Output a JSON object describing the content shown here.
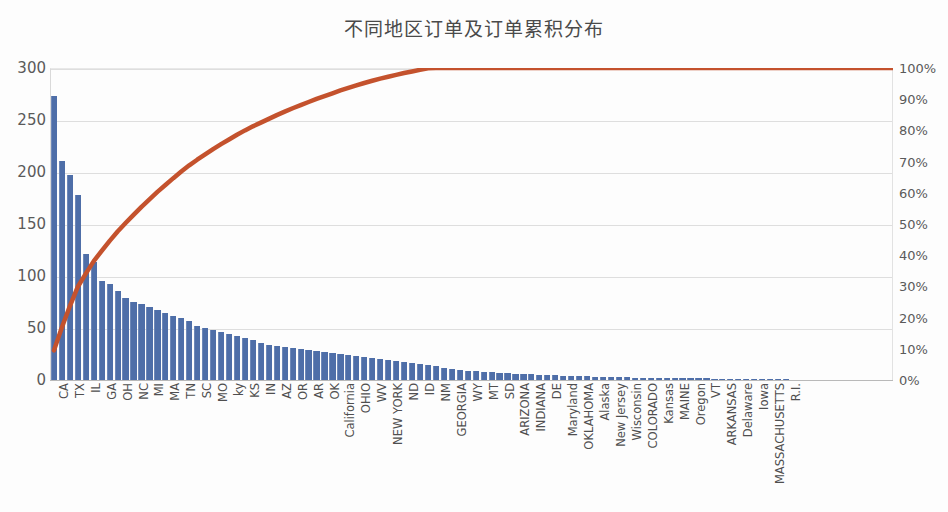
{
  "chart_data": {
    "type": "bar",
    "title": "不同地区订单及订单累积分布",
    "xlabel": "",
    "ylabel": "",
    "ylim": [
      0,
      300
    ],
    "y2lim": [
      0,
      100
    ],
    "grid": true,
    "legend": "none",
    "bar_color": "#4e6ea8",
    "line_color": "#c4522d",
    "yticks": [
      "0",
      "50",
      "100",
      "150",
      "200",
      "250",
      "300"
    ],
    "ytick_values": [
      0,
      50,
      100,
      150,
      200,
      250,
      300
    ],
    "y2ticks": [
      "0%",
      "10%",
      "20%",
      "30%",
      "40%",
      "50%",
      "60%",
      "70%",
      "80%",
      "90%",
      "100%"
    ],
    "y2tick_values": [
      0,
      10,
      20,
      30,
      40,
      50,
      60,
      70,
      80,
      90,
      100
    ],
    "categories": [
      "CA",
      "",
      "TX",
      "",
      "IL",
      "",
      "GA",
      "",
      "OH",
      "",
      "NC",
      "",
      "MI",
      "",
      "MA",
      "",
      "TN",
      "",
      "SC",
      "",
      "MO",
      "",
      "ky",
      "",
      "KS",
      "",
      "IN",
      "",
      "AZ",
      "",
      "OR",
      "",
      "AR",
      "",
      "OK",
      "",
      "California",
      "",
      "OHIO",
      "",
      "WV",
      "",
      "NEW YORK",
      "",
      "ND",
      "",
      "ID",
      "",
      "NM",
      "",
      "GEORGIA",
      "",
      "WY",
      "",
      "MT",
      "",
      "SD",
      "",
      "ARIZONA",
      "",
      "INDIANA",
      "",
      "DE",
      "",
      "Maryland",
      "",
      "OKLAHOMA",
      "",
      "Alaska",
      "",
      "New Jersey",
      "",
      "Wisconsin",
      "",
      "COLORADO",
      "",
      "Kansas",
      "",
      "MAINE",
      "",
      "Oregon",
      "",
      "VT",
      "",
      "ARKANSAS",
      "",
      "Delaware",
      "",
      "Iowa",
      "",
      "MASSACHUSETTS",
      "",
      "R.I."
    ],
    "visible_tick_labels": [
      "CA",
      "TX",
      "IL",
      "GA",
      "OH",
      "NC",
      "MI",
      "MA",
      "TN",
      "SC",
      "MO",
      "ky",
      "KS",
      "IN",
      "AZ",
      "OR",
      "AR",
      "OK",
      "California",
      "OHIO",
      "WV",
      "NEW YORK",
      "ND",
      "ID",
      "NM",
      "GEORGIA",
      "WY",
      "MT",
      "SD",
      "ARIZONA",
      "INDIANA",
      "DE",
      "Maryland",
      "OKLAHOMA",
      "Alaska",
      "New Jersey",
      "Wisconsin",
      "COLORADO",
      "Kansas",
      "MAINE",
      "Oregon",
      "VT",
      "ARKANSAS",
      "Delaware",
      "Iowa",
      "MASSACHUSETTS",
      "R.I."
    ],
    "series": [
      {
        "name": "订单数",
        "type": "bar",
        "values": [
          273,
          211,
          197,
          178,
          121,
          113,
          95,
          92,
          86,
          79,
          75,
          73,
          70,
          67,
          64,
          62,
          60,
          57,
          52,
          50,
          48,
          46,
          44,
          42,
          40,
          38,
          36,
          34,
          33,
          32,
          31,
          30,
          29,
          28,
          27,
          26,
          25,
          24,
          23,
          22,
          21,
          20,
          19,
          18,
          17,
          16,
          15,
          14,
          13,
          12,
          11,
          10,
          9,
          9,
          8,
          8,
          7,
          7,
          6,
          6,
          6,
          5,
          5,
          5,
          4,
          4,
          4,
          4,
          3,
          3,
          3,
          3,
          3,
          2,
          2,
          2,
          2,
          2,
          2,
          2,
          2,
          2,
          2,
          1,
          1,
          1,
          1,
          1,
          1,
          1,
          1,
          1,
          1
        ]
      },
      {
        "name": "累积百分比",
        "type": "line",
        "values": [
          9.5,
          16.9,
          23.7,
          29.9,
          34.1,
          38.1,
          41.4,
          44.6,
          47.6,
          50.3,
          52.9,
          55.5,
          57.9,
          60.3,
          62.5,
          64.7,
          66.8,
          68.8,
          70.6,
          72.3,
          74.0,
          75.6,
          77.1,
          78.6,
          80.0,
          81.3,
          82.5,
          83.7,
          84.9,
          86.0,
          87.1,
          88.1,
          89.1,
          90.1,
          91.0,
          91.9,
          92.8,
          93.6,
          94.4,
          95.2,
          95.9,
          96.6,
          97.2,
          97.8,
          98.4,
          98.9,
          99.4,
          99.9,
          100.0,
          100.0,
          100.0,
          100.0,
          100.0,
          100.0,
          100.0,
          100.0,
          100.0,
          100.0,
          100.0,
          100.0,
          100.0,
          100.0,
          100.0,
          100.0,
          100.0,
          100.0,
          100.0,
          100.0,
          100.0,
          100.0,
          100.0,
          100.0,
          100.0,
          100.0,
          100.0,
          100.0,
          100.0,
          100.0,
          100.0,
          100.0,
          100.0,
          100.0,
          100.0,
          100.0,
          100.0,
          100.0,
          100.0,
          100.0,
          100.0,
          100.0,
          100.0,
          100.0,
          100.0
        ]
      }
    ]
  }
}
